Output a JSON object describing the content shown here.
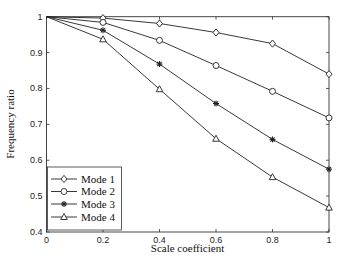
{
  "chart_data": {
    "type": "line",
    "title": "",
    "xlabel": "Scale coefficient",
    "ylabel": "Frequency ratio",
    "x": [
      0,
      0.2,
      0.4,
      0.6,
      0.8,
      1
    ],
    "xlim": [
      0,
      1
    ],
    "ylim": [
      0.4,
      1
    ],
    "xticks": [
      "0",
      "0.2",
      "0.4",
      "0.6",
      "0.8",
      "1"
    ],
    "yticks": [
      "0.4",
      "0.5",
      "0.6",
      "0.7",
      "0.8",
      "0.9",
      "1"
    ],
    "grid": false,
    "legend_position": "lower left",
    "series": [
      {
        "name": "Mode 1",
        "marker": "diamond",
        "values": [
          1,
          0.996,
          0.981,
          0.956,
          0.925,
          0.84
        ]
      },
      {
        "name": "Mode 2",
        "marker": "circle",
        "values": [
          1,
          0.984,
          0.934,
          0.864,
          0.792,
          0.718
        ]
      },
      {
        "name": "Mode 3",
        "marker": "asterisk",
        "values": [
          1,
          0.962,
          0.868,
          0.758,
          0.658,
          0.575
        ]
      },
      {
        "name": "Mode 4",
        "marker": "triangle",
        "values": [
          1,
          0.937,
          0.798,
          0.66,
          0.553,
          0.468
        ]
      }
    ]
  },
  "colors": {
    "line": "#222222",
    "axis": "#333333",
    "background": "#ffffff"
  }
}
